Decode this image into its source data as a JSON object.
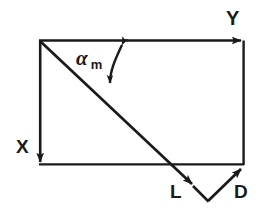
{
  "figure": {
    "kind": "geometry-vector-diagram",
    "background_color": "#ffffff",
    "stroke_color": "#1a1a1a",
    "labels": {
      "y_axis": "Y",
      "x_axis": "X",
      "lift": "L",
      "drag": "D",
      "angle_symbol": "α",
      "angle_subscript": "m"
    },
    "geometry": {
      "rect_top_left": [
        39,
        40
      ],
      "rect_top_right": [
        244,
        40
      ],
      "rect_bottom_left": [
        39,
        165
      ],
      "rect_bottom_right": [
        244,
        165
      ],
      "diagonal_start": [
        39,
        40
      ],
      "diagonal_arrow_tip": [
        194,
        186
      ],
      "v_vertex": [
        208,
        201
      ],
      "d_arrow_tip": [
        242,
        168
      ],
      "arc_top_point": [
        122,
        42
      ],
      "arc_bottom_point": [
        109,
        86
      ]
    }
  }
}
